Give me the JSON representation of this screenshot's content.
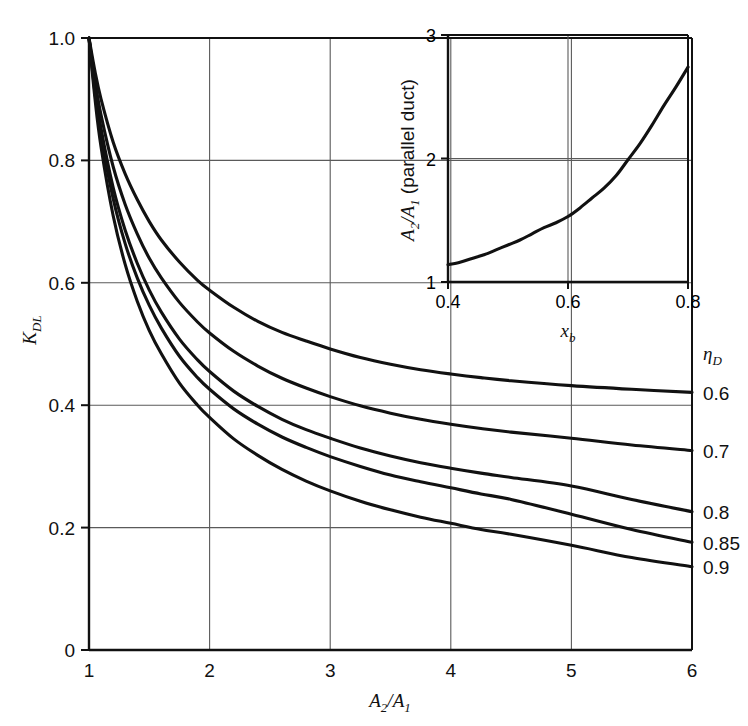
{
  "figure": {
    "background_color": "#ffffff",
    "ink_color": "#111111",
    "grid_color": "#5a5a5a"
  },
  "chart_data": [
    {
      "id": "main",
      "type": "line",
      "title": "",
      "xlabel": "A2/A1",
      "xlabel_parts": {
        "base1": "A",
        "sub1": "2",
        "slash": "/",
        "base2": "A",
        "sub2": "1"
      },
      "ylabel": "KDL",
      "ylabel_parts": {
        "base": "K",
        "sub": "DL"
      },
      "xlim": [
        1,
        6
      ],
      "ylim": [
        0,
        1.0
      ],
      "xticks": [
        1,
        2,
        3,
        4,
        5,
        6
      ],
      "xtick_labels": [
        "1",
        "2",
        "3",
        "4",
        "5",
        "6"
      ],
      "yticks": [
        0,
        0.2,
        0.4,
        0.6,
        0.8,
        1.0
      ],
      "ytick_labels": [
        "0",
        "0.2",
        "0.4",
        "0.6",
        "0.8",
        "1.0"
      ],
      "grid": true,
      "grid_x": [
        2,
        3,
        4,
        5
      ],
      "grid_y": [
        0.2,
        0.4,
        0.6,
        0.8
      ],
      "legend_title": "nD",
      "legend_title_parts": {
        "base": "η",
        "sub": "D"
      },
      "legend_position": "right-outside",
      "series": [
        {
          "name": "0.6",
          "label": "0.6",
          "end_value": 0.42,
          "x": [
            1.0,
            1.05,
            1.1,
            1.2,
            1.3,
            1.4,
            1.5,
            1.6,
            1.75,
            1.9,
            2.0,
            2.2,
            2.4,
            2.6,
            2.8,
            3.0,
            3.25,
            3.5,
            3.75,
            4.0,
            4.25,
            4.5,
            5.0,
            5.5,
            6.0
          ],
          "values": [
            1.0,
            0.945,
            0.9,
            0.83,
            0.778,
            0.736,
            0.7,
            0.67,
            0.634,
            0.604,
            0.588,
            0.56,
            0.537,
            0.519,
            0.505,
            0.492,
            0.478,
            0.467,
            0.458,
            0.451,
            0.445,
            0.44,
            0.432,
            0.426,
            0.421
          ]
        },
        {
          "name": "0.7",
          "label": "0.7",
          "end_value": 0.325,
          "x": [
            1.0,
            1.05,
            1.1,
            1.2,
            1.3,
            1.4,
            1.5,
            1.6,
            1.75,
            1.9,
            2.0,
            2.2,
            2.4,
            2.6,
            2.8,
            3.0,
            3.25,
            3.5,
            3.75,
            4.0,
            4.25,
            4.5,
            5.0,
            5.5,
            6.0
          ],
          "values": [
            1.0,
            0.93,
            0.874,
            0.79,
            0.728,
            0.68,
            0.64,
            0.608,
            0.568,
            0.536,
            0.518,
            0.488,
            0.464,
            0.444,
            0.428,
            0.414,
            0.399,
            0.387,
            0.377,
            0.369,
            0.362,
            0.356,
            0.346,
            0.335,
            0.326
          ]
        },
        {
          "name": "0.8",
          "label": "0.8",
          "end_value": 0.225,
          "x": [
            1.0,
            1.05,
            1.1,
            1.2,
            1.3,
            1.4,
            1.5,
            1.6,
            1.75,
            1.9,
            2.0,
            2.2,
            2.4,
            2.6,
            2.8,
            3.0,
            3.25,
            3.5,
            3.75,
            4.0,
            4.25,
            4.5,
            5.0,
            5.5,
            6.0
          ],
          "values": [
            1.0,
            0.918,
            0.852,
            0.756,
            0.686,
            0.632,
            0.588,
            0.552,
            0.508,
            0.474,
            0.455,
            0.423,
            0.398,
            0.377,
            0.36,
            0.346,
            0.33,
            0.317,
            0.306,
            0.297,
            0.289,
            0.282,
            0.268,
            0.246,
            0.226
          ]
        },
        {
          "name": "0.85",
          "label": "0.85",
          "end_value": 0.175,
          "x": [
            1.0,
            1.05,
            1.1,
            1.2,
            1.3,
            1.4,
            1.5,
            1.6,
            1.75,
            1.9,
            2.0,
            2.2,
            2.4,
            2.6,
            2.8,
            3.0,
            3.25,
            3.5,
            3.75,
            4.0,
            4.25,
            4.5,
            5.0,
            5.5,
            6.0
          ],
          "values": [
            1.0,
            0.91,
            0.84,
            0.738,
            0.664,
            0.608,
            0.563,
            0.526,
            0.48,
            0.445,
            0.426,
            0.394,
            0.369,
            0.348,
            0.331,
            0.316,
            0.3,
            0.286,
            0.275,
            0.265,
            0.255,
            0.246,
            0.222,
            0.197,
            0.176
          ]
        },
        {
          "name": "0.9",
          "label": "0.9",
          "end_value": 0.135,
          "x": [
            1.0,
            1.05,
            1.1,
            1.2,
            1.3,
            1.4,
            1.5,
            1.6,
            1.75,
            1.9,
            2.0,
            2.2,
            2.4,
            2.6,
            2.8,
            3.0,
            3.25,
            3.5,
            3.75,
            4.0,
            4.25,
            4.5,
            5.0,
            5.5,
            6.0
          ],
          "values": [
            1.0,
            0.9,
            0.822,
            0.71,
            0.63,
            0.57,
            0.522,
            0.484,
            0.436,
            0.4,
            0.38,
            0.345,
            0.318,
            0.295,
            0.276,
            0.26,
            0.243,
            0.229,
            0.217,
            0.207,
            0.197,
            0.189,
            0.171,
            0.151,
            0.136
          ]
        }
      ]
    },
    {
      "id": "inset",
      "type": "line",
      "title": "",
      "xlabel": "xb",
      "xlabel_parts": {
        "base": "x",
        "sub": "b"
      },
      "ylabel": "A2/A1 (parallel duct)",
      "ylabel_parts": {
        "base1": "A",
        "sub1": "2",
        "slash": "/",
        "base2": "A",
        "sub2": "1",
        "suffix": " (parallel duct)"
      },
      "xlim": [
        0.4,
        0.8
      ],
      "ylim": [
        1,
        3
      ],
      "xticks": [
        0.4,
        0.6,
        0.8
      ],
      "xtick_labels": [
        "0.4",
        "0.6",
        "0.8"
      ],
      "yticks": [
        1,
        2,
        3
      ],
      "ytick_labels": [
        "1",
        "2",
        "3"
      ],
      "grid": true,
      "grid_x": [
        0.6
      ],
      "grid_y": [
        2
      ],
      "series": [
        {
          "name": "parallel-duct-area-ratio",
          "label": "",
          "x": [
            0.4,
            0.42,
            0.44,
            0.46,
            0.48,
            0.5,
            0.52,
            0.54,
            0.56,
            0.58,
            0.6,
            0.62,
            0.64,
            0.66,
            0.68,
            0.7,
            0.72,
            0.74,
            0.76,
            0.78,
            0.8
          ],
          "values": [
            1.14,
            1.16,
            1.19,
            1.22,
            1.26,
            1.3,
            1.34,
            1.39,
            1.44,
            1.48,
            1.53,
            1.6,
            1.68,
            1.76,
            1.86,
            1.99,
            2.12,
            2.27,
            2.43,
            2.58,
            2.74
          ]
        }
      ]
    }
  ]
}
